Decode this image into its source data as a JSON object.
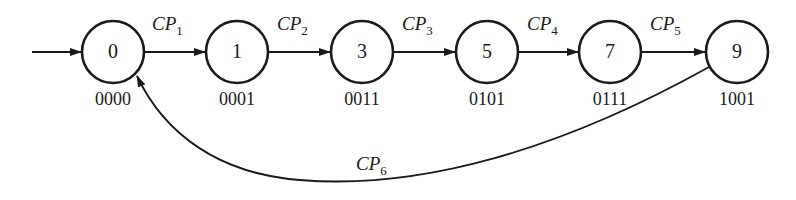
{
  "diagram": {
    "type": "state-transition",
    "colors": {
      "stroke": "#1a1a1a",
      "background": "#ffffff"
    },
    "states": [
      {
        "id": "0",
        "label": "0",
        "code": "0000",
        "cx": 113
      },
      {
        "id": "1",
        "label": "1",
        "code": "0001",
        "cx": 237
      },
      {
        "id": "3",
        "label": "3",
        "code": "0011",
        "cx": 362
      },
      {
        "id": "5",
        "label": "5",
        "code": "0101",
        "cx": 487
      },
      {
        "id": "7",
        "label": "7",
        "code": "0111",
        "cx": 610
      },
      {
        "id": "9",
        "label": "9",
        "code": "1001",
        "cx": 737
      }
    ],
    "transitions": [
      {
        "from": "0",
        "to": "1",
        "label": "CP",
        "sub": "1"
      },
      {
        "from": "1",
        "to": "3",
        "label": "CP",
        "sub": "2"
      },
      {
        "from": "3",
        "to": "5",
        "label": "CP",
        "sub": "3"
      },
      {
        "from": "5",
        "to": "7",
        "label": "CP",
        "sub": "4"
      },
      {
        "from": "7",
        "to": "9",
        "label": "CP",
        "sub": "5"
      },
      {
        "from": "9",
        "to": "0",
        "label": "CP",
        "sub": "6"
      }
    ],
    "initial_state": "0"
  }
}
